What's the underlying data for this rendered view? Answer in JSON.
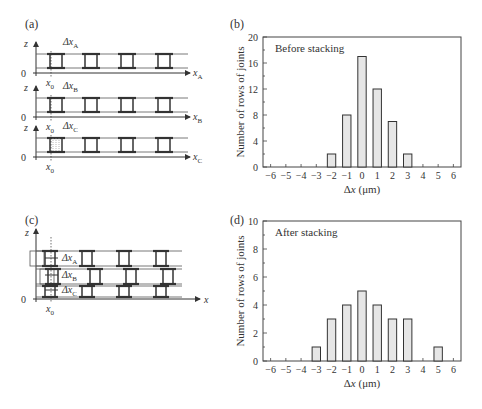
{
  "panels": {
    "a": {
      "label": "(a)",
      "rows": [
        {
          "z": "z",
          "zero": "0",
          "x0": "x",
          "x0_sub": "0",
          "dx": "Δx",
          "dx_sub": "A",
          "axis": "x",
          "axis_sub": "A"
        },
        {
          "z": "z",
          "zero": "0",
          "x0": "x",
          "x0_sub": "0",
          "dx": "Δx",
          "dx_sub": "B",
          "axis": "x",
          "axis_sub": "B"
        },
        {
          "z": "z",
          "zero": "0",
          "x0": "x",
          "x0_sub": "0",
          "dx": "Δx",
          "dx_sub": "C",
          "axis": "x",
          "axis_sub": "C"
        }
      ]
    },
    "b": {
      "label": "(b)"
    },
    "c": {
      "label": "(c)",
      "z": "z",
      "zero": "0",
      "x0": "x",
      "x0_sub": "0",
      "axis": "x",
      "dx_labels": [
        {
          "t": "Δx",
          "s": "A"
        },
        {
          "t": "Δx",
          "s": "B"
        },
        {
          "t": "Δx",
          "s": "C"
        }
      ]
    },
    "d": {
      "label": "(d)"
    }
  },
  "chart_data": [
    {
      "type": "bar",
      "title": "Before stacking",
      "xlabel": "Δx (μm)",
      "ylabel": "Number of rows of joints",
      "x_ticks": [
        -6,
        -5,
        -4,
        -3,
        -2,
        -1,
        0,
        1,
        2,
        3,
        4,
        5,
        6
      ],
      "y_ticks": [
        0,
        4,
        8,
        12,
        16,
        20
      ],
      "ylim": [
        0,
        20
      ],
      "xlim": [
        -6.5,
        6.5
      ],
      "categories": [
        -2,
        -1,
        0,
        1,
        2,
        3
      ],
      "values": [
        2,
        8,
        17,
        12,
        7,
        2
      ],
      "grid": false,
      "bar_fill": "#e6e6e6"
    },
    {
      "type": "bar",
      "title": "After stacking",
      "xlabel": "Δx (μm)",
      "ylabel": "Number of rows of joints",
      "x_ticks": [
        -6,
        -5,
        -4,
        -3,
        -2,
        -1,
        0,
        1,
        2,
        3,
        4,
        5,
        6
      ],
      "y_ticks": [
        0,
        2,
        4,
        6,
        8,
        10
      ],
      "ylim": [
        0,
        10
      ],
      "xlim": [
        -6.5,
        6.5
      ],
      "categories": [
        -3,
        -2,
        -1,
        0,
        1,
        2,
        3,
        5
      ],
      "values": [
        1,
        3,
        4,
        5,
        4,
        3,
        3,
        1
      ],
      "grid": false,
      "bar_fill": "#e6e6e6"
    }
  ]
}
